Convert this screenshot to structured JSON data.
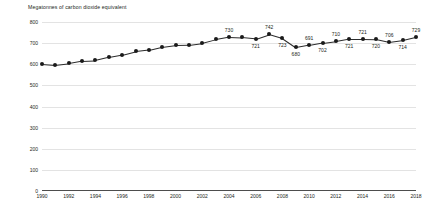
{
  "chart_data": {
    "type": "line",
    "title": "Megatonnes of carbon dioxide equivalent",
    "xlabel": "",
    "ylabel": "",
    "ylim": [
      0,
      800
    ],
    "ytick_values": [
      0,
      100,
      200,
      300,
      400,
      500,
      600,
      700,
      800
    ],
    "ytick_labels": [
      "0",
      "100",
      "200",
      "300",
      "400",
      "500",
      "600",
      "700",
      "800"
    ],
    "xlim": [
      1990,
      2018
    ],
    "xtick_values": [
      1990,
      1992,
      1994,
      1996,
      1998,
      2000,
      2002,
      2004,
      2006,
      2008,
      2010,
      2012,
      2014,
      2016,
      2018
    ],
    "xtick_labels": [
      "1990",
      "1992",
      "1994",
      "1996",
      "1998",
      "2000",
      "2002",
      "2004",
      "2006",
      "2008",
      "2010",
      "2012",
      "2014",
      "2016",
      "2018"
    ],
    "grid": true,
    "legend": "none",
    "marker_color": "#1a1a1a",
    "line_color": "#2b2b2b",
    "grid_color": "#e3e3e3",
    "axis_color": "#4d4d4d",
    "x": [
      1990,
      1991,
      1992,
      1993,
      1994,
      1995,
      1996,
      1997,
      1998,
      1999,
      2000,
      2001,
      2002,
      2003,
      2004,
      2005,
      2006,
      2007,
      2008,
      2009,
      2010,
      2011,
      2012,
      2013,
      2014,
      2015,
      2016,
      2017,
      2018
    ],
    "values": [
      602,
      597,
      604,
      615,
      618,
      633,
      645,
      661,
      668,
      683,
      692,
      693,
      701,
      718,
      730,
      727,
      721,
      742,
      723,
      680,
      691,
      702,
      710,
      721,
      721,
      720,
      706,
      714,
      729
    ],
    "point_labels": [
      {
        "x": 2004,
        "value": 730,
        "text": "730",
        "position": "above"
      },
      {
        "x": 2006,
        "value": 721,
        "text": "721",
        "position": "below"
      },
      {
        "x": 2007,
        "value": 742,
        "text": "742",
        "position": "above"
      },
      {
        "x": 2008,
        "value": 723,
        "text": "723",
        "position": "below"
      },
      {
        "x": 2009,
        "value": 680,
        "text": "680",
        "position": "below"
      },
      {
        "x": 2010,
        "value": 691,
        "text": "691",
        "position": "above"
      },
      {
        "x": 2011,
        "value": 702,
        "text": "702",
        "position": "below"
      },
      {
        "x": 2012,
        "value": 710,
        "text": "710",
        "position": "above"
      },
      {
        "x": 2013,
        "value": 721,
        "text": "721",
        "position": "below"
      },
      {
        "x": 2014,
        "value": 721,
        "text": "721",
        "position": "above"
      },
      {
        "x": 2015,
        "value": 720,
        "text": "720",
        "position": "below"
      },
      {
        "x": 2016,
        "value": 706,
        "text": "706",
        "position": "above"
      },
      {
        "x": 2017,
        "value": 714,
        "text": "714",
        "position": "below"
      },
      {
        "x": 2018,
        "value": 729,
        "text": "729",
        "position": "above"
      }
    ]
  }
}
